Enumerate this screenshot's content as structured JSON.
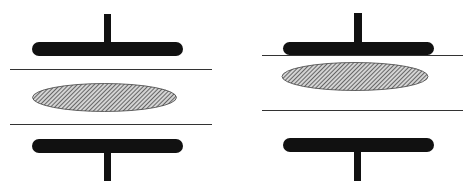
{
  "diagram": {
    "description": "Two side-by-side schematic panels showing a hatched elliptical element between two thin horizontal lines, each flanked by T-shaped electrode plates (rounded bar with stem) above and below.",
    "colors": {
      "plate": "#111111",
      "line": "#333333",
      "ellipse_fill": "#bdbdbd",
      "hatch": "#222222",
      "background": "#ffffff"
    },
    "panels": [
      {
        "label": "left",
        "state": "ellipse centered between lines",
        "top_plate": {
          "bar": [
            32,
            42,
            151,
            14
          ],
          "stem": [
            104,
            14,
            7,
            30
          ]
        },
        "line_top_y": 69,
        "line_bottom_y": 124,
        "line_x": [
          10,
          212
        ],
        "ellipse": {
          "cx": 104,
          "cy": 97,
          "rx": 72,
          "ry": 14
        },
        "bottom_plate": {
          "bar": [
            32,
            139,
            151,
            14
          ],
          "stem": [
            104,
            152,
            7,
            29
          ]
        }
      },
      {
        "label": "right",
        "state": "top line touching top plate, ellipse displaced upward",
        "top_plate": {
          "bar": [
            283,
            42,
            151,
            13
          ],
          "stem": [
            354,
            13,
            8,
            30
          ]
        },
        "line_top_y": 55,
        "line_bottom_y": 110,
        "line_x": [
          262,
          463
        ],
        "ellipse": {
          "cx": 355,
          "cy": 77,
          "rx": 73,
          "ry": 14
        },
        "bottom_plate": {
          "bar": [
            283,
            138,
            151,
            14
          ],
          "stem": [
            354,
            151,
            7,
            30
          ]
        }
      }
    ]
  }
}
